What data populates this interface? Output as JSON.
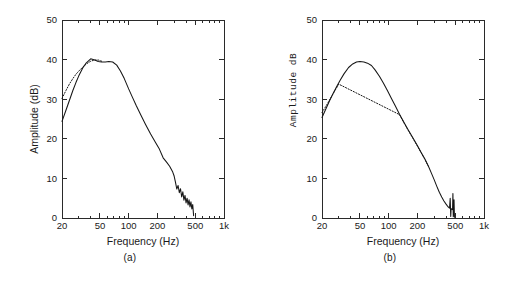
{
  "figure": {
    "panels": [
      {
        "caption": "(a)",
        "xlabel": "Frequency (Hz)",
        "ylabel": "Amplitude (dB)",
        "ylabel_style": "sans"
      },
      {
        "caption": "(b)",
        "xlabel": "Frequency (Hz)",
        "ylabel": "Amplitude  dB",
        "ylabel_style": "mono"
      }
    ]
  },
  "chart_data": [
    {
      "type": "line",
      "title": "",
      "panel": "(a)",
      "xlabel": "Frequency (Hz)",
      "ylabel": "Amplitude (dB)",
      "xscale": "log",
      "xlim": [
        20,
        1000
      ],
      "ylim": [
        0,
        50
      ],
      "xticks": [
        20,
        50,
        100,
        200,
        500,
        1000
      ],
      "xticklabels": [
        "20",
        "50",
        "100",
        "200",
        "500",
        "1k"
      ],
      "yticks": [
        0,
        10,
        20,
        30,
        40,
        50
      ],
      "yticklabels": [
        "0",
        "10",
        "20",
        "30",
        "40",
        "50"
      ],
      "grid": false,
      "legend": null,
      "series": [
        {
          "name": "measured",
          "style": "solid",
          "x": [
            20,
            22,
            24,
            26,
            28,
            30,
            33,
            36,
            40,
            44,
            48,
            52,
            57,
            62,
            68,
            75,
            82,
            90,
            100,
            110,
            120,
            135,
            150,
            170,
            190,
            210,
            230,
            250,
            270,
            290,
            300,
            310,
            320,
            330,
            340,
            350,
            360,
            370,
            380,
            390,
            400,
            410,
            420,
            430,
            440,
            450,
            460,
            470,
            480
          ],
          "y": [
            24.4,
            27.2,
            29.8,
            32.2,
            34.2,
            35.9,
            37.9,
            39.2,
            40.2,
            39.9,
            39.5,
            39.4,
            39.4,
            39.5,
            39.4,
            38.6,
            37.1,
            35.2,
            32.6,
            30.4,
            28.4,
            25.9,
            23.7,
            21.2,
            19.2,
            17.4,
            15.2,
            14.1,
            13.0,
            11.6,
            10.6,
            9.0,
            7.3,
            8.2,
            6.4,
            7.4,
            5.3,
            6.6,
            4.5,
            5.7,
            3.8,
            5.0,
            3.3,
            4.6,
            2.8,
            4.1,
            2.3,
            3.4,
            0.6
          ]
        },
        {
          "name": "model",
          "style": "dotted",
          "x": [
            20,
            22,
            24,
            26,
            28,
            30,
            33,
            36,
            40,
            44,
            48,
            52
          ],
          "y": [
            30.2,
            32.2,
            33.9,
            35.2,
            36.3,
            37.1,
            38.1,
            38.9,
            39.6,
            39.9,
            39.9,
            39.6
          ]
        }
      ]
    },
    {
      "type": "line",
      "title": "",
      "panel": "(b)",
      "xlabel": "Frequency (Hz)",
      "ylabel": "Amplitude  dB",
      "xscale": "log",
      "xlim": [
        20,
        1000
      ],
      "ylim": [
        0,
        50
      ],
      "xticks": [
        20,
        50,
        100,
        200,
        500,
        1000
      ],
      "xticklabels": [
        "20",
        "50",
        "100",
        "200",
        "500",
        "1k"
      ],
      "yticks": [
        0,
        10,
        20,
        30,
        40,
        50
      ],
      "yticklabels": [
        "0",
        "10",
        "20",
        "30",
        "40",
        "50"
      ],
      "grid": false,
      "legend": null,
      "series": [
        {
          "name": "measured",
          "style": "solid",
          "x": [
            20,
            22,
            24,
            26,
            28,
            31,
            34,
            38,
            42,
            46,
            50,
            55,
            60,
            66,
            72,
            80,
            88,
            97,
            107,
            118,
            130,
            145,
            160,
            180,
            200,
            220,
            240,
            260,
            280,
            300,
            320,
            340,
            360,
            380,
            400,
            415,
            425,
            435,
            442,
            448,
            452,
            458,
            462,
            468,
            472,
            476,
            480,
            485,
            490
          ],
          "y": [
            25.4,
            27.6,
            29.6,
            31.3,
            32.8,
            34.8,
            36.4,
            38.0,
            38.9,
            39.4,
            39.5,
            39.4,
            39.1,
            38.5,
            37.4,
            35.8,
            34.1,
            32.2,
            30.2,
            28.2,
            26.2,
            24.1,
            22.3,
            20.2,
            18.3,
            16.5,
            14.9,
            13.2,
            11.4,
            9.7,
            8.0,
            6.5,
            5.3,
            4.3,
            3.5,
            3.0,
            2.7,
            2.5,
            5.0,
            0.4,
            2.4,
            2.2,
            2.2,
            2.1,
            6.2,
            0.3,
            2.0,
            4.6,
            0.2
          ]
        },
        {
          "name": "model",
          "style": "dotted",
          "x": [
            20,
            23,
            26,
            30,
            130,
            145,
            160,
            180,
            200,
            220,
            240,
            260
          ],
          "y": [
            26.6,
            29.0,
            31.3,
            33.8,
            26.1,
            24.0,
            22.2,
            20.1,
            18.2,
            16.4,
            14.8,
            13.1
          ]
        }
      ]
    }
  ]
}
